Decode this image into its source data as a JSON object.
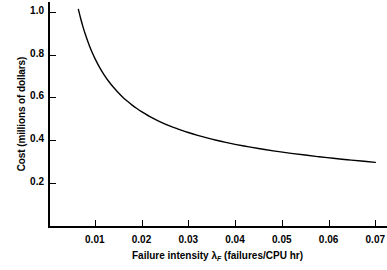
{
  "chart_data": {
    "type": "line",
    "title": "",
    "xlabel": "Failure intensity λ_F (failures/CPU hr)",
    "xlabel_main": "Failure intensity λ",
    "xlabel_sub": "F",
    "xlabel_tail": " (failures/CPU hr)",
    "ylabel": "Cost (millions of dollars)",
    "xlim": [
      0.0,
      0.0725
    ],
    "ylim": [
      0.0,
      1.045
    ],
    "grid": false,
    "legend": null,
    "xticks": [
      0.01,
      0.02,
      0.03,
      0.04,
      0.05,
      0.06,
      0.07
    ],
    "xtick_labels": [
      "0.01",
      "0.02",
      "0.03",
      "0.04",
      "0.05",
      "0.06",
      "0.07"
    ],
    "yticks": [
      0.2,
      0.4,
      0.6,
      0.8,
      1.0
    ],
    "ytick_labels": [
      "0.2",
      "0.4",
      "0.6",
      "0.8",
      "1.0"
    ],
    "line_color": "#000000",
    "line_width": 1.4,
    "series": [
      {
        "name": "cost",
        "x": [
          0.0065,
          0.007,
          0.0075,
          0.008,
          0.0085,
          0.009,
          0.0095,
          0.01,
          0.011,
          0.012,
          0.013,
          0.014,
          0.015,
          0.016,
          0.017,
          0.018,
          0.019,
          0.02,
          0.022,
          0.024,
          0.026,
          0.028,
          0.03,
          0.032,
          0.034,
          0.036,
          0.038,
          0.04,
          0.043,
          0.046,
          0.049,
          0.052,
          0.055,
          0.058,
          0.061,
          0.064,
          0.067,
          0.07
        ],
        "y": [
          1.01,
          0.967,
          0.928,
          0.893,
          0.862,
          0.833,
          0.807,
          0.783,
          0.741,
          0.705,
          0.674,
          0.647,
          0.623,
          0.601,
          0.582,
          0.564,
          0.548,
          0.534,
          0.508,
          0.486,
          0.467,
          0.451,
          0.436,
          0.423,
          0.411,
          0.4,
          0.39,
          0.381,
          0.369,
          0.358,
          0.348,
          0.339,
          0.331,
          0.323,
          0.316,
          0.309,
          0.303,
          0.297
        ]
      }
    ]
  }
}
